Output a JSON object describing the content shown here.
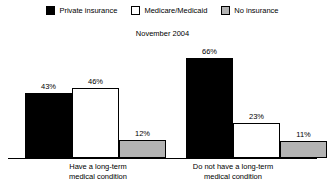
{
  "chart_data": {
    "type": "bar",
    "title": "",
    "subtitle": "November 2004",
    "xlabel": "",
    "ylabel": "",
    "ylim": [
      0,
      70
    ],
    "grid": false,
    "legend_position": "top-center",
    "value_suffix": "%",
    "categories": [
      "Have a long-term\nmedical condition",
      "Do not have a long-term\nmedical condition"
    ],
    "category_lines": [
      [
        "Have a long-term",
        "medical condition"
      ],
      [
        "Do not have a long-term",
        "medical condition"
      ]
    ],
    "series": [
      {
        "name": "Private insurance",
        "color": "#000000",
        "border": "#000000",
        "values": [
          43,
          66
        ],
        "labels": [
          "43%",
          "66%"
        ]
      },
      {
        "name": "Medicare/Medicaid",
        "color": "#ffffff",
        "border": "#000000",
        "values": [
          46,
          23
        ],
        "labels": [
          "46%",
          "23%"
        ]
      },
      {
        "name": "No insurance",
        "color": "#b3b3b3",
        "border": "#000000",
        "values": [
          12,
          11
        ],
        "labels": [
          "12%",
          "11%"
        ]
      }
    ]
  },
  "legend": {
    "items": [
      {
        "label": "Private insurance",
        "swatch": "#000000"
      },
      {
        "label": "Medicare/Medicaid",
        "swatch": "#ffffff"
      },
      {
        "label": "No insurance",
        "swatch": "#b3b3b3"
      }
    ]
  },
  "subtitle": "November 2004",
  "axis": {
    "baseline_color": "#000000"
  }
}
